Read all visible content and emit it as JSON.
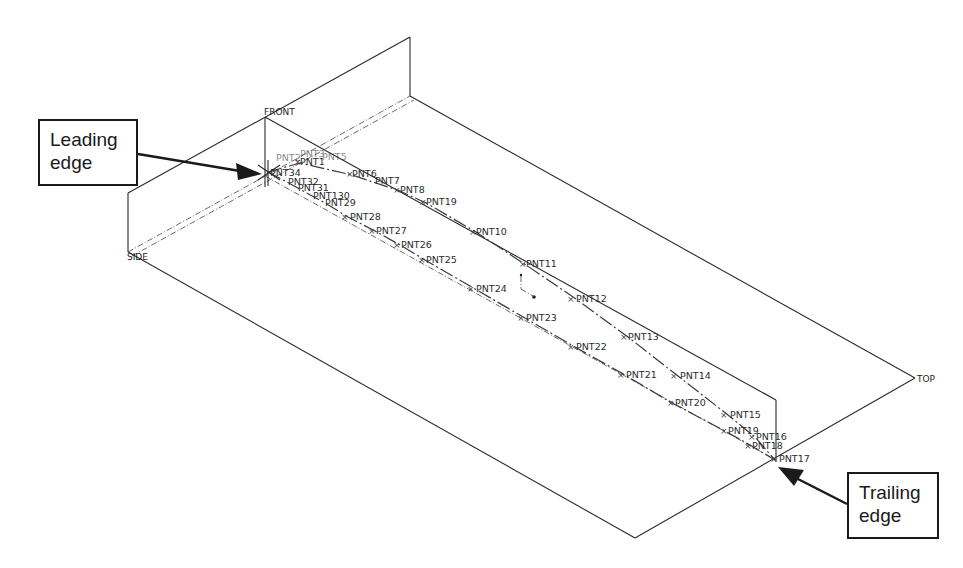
{
  "diagram": {
    "planes": [
      {
        "name": "FRONT",
        "label_pos": [
          264,
          115
        ]
      },
      {
        "name": "SIDE",
        "label_pos": [
          127,
          260
        ]
      },
      {
        "name": "TOP",
        "label_pos": [
          917,
          382
        ]
      }
    ],
    "callouts": {
      "leading": {
        "line1": "Leading",
        "line2": "edge"
      },
      "trailing": {
        "line1": "Trailing",
        "line2": "edge"
      }
    },
    "upper_surface_points": [
      {
        "label": "PNT1",
        "x": 300,
        "y": 163
      },
      {
        "label": "PNT6",
        "x": 352,
        "y": 175
      },
      {
        "label": "PNT7",
        "x": 375,
        "y": 182
      },
      {
        "label": "PNT8",
        "x": 400,
        "y": 191
      },
      {
        "label": "PNT19",
        "x": 426,
        "y": 203
      },
      {
        "label": "PNT10",
        "x": 476,
        "y": 232
      },
      {
        "label": "PNT11",
        "x": 526,
        "y": 265
      },
      {
        "label": "PNT12",
        "x": 576,
        "y": 299
      },
      {
        "label": "PNT13",
        "x": 628,
        "y": 337
      },
      {
        "label": "PNT14",
        "x": 678,
        "y": 376
      },
      {
        "label": "PNT15",
        "x": 728,
        "y": 415
      },
      {
        "label": "PNT16",
        "x": 755,
        "y": 437
      }
    ],
    "lower_surface_points": [
      {
        "label": "PNT34",
        "x": 270,
        "y": 173
      },
      {
        "label": "PNT32",
        "x": 285,
        "y": 181
      },
      {
        "label": "PNT31",
        "x": 298,
        "y": 189
      },
      {
        "label": "PNT130",
        "x": 318,
        "y": 196
      },
      {
        "label": "PNT29",
        "x": 325,
        "y": 203
      },
      {
        "label": "PNT28",
        "x": 348,
        "y": 217
      },
      {
        "label": "PNT27",
        "x": 375,
        "y": 231
      },
      {
        "label": "PNT26",
        "x": 400,
        "y": 245
      },
      {
        "label": "PNT25",
        "x": 425,
        "y": 260
      },
      {
        "label": "PNT24",
        "x": 475,
        "y": 289
      },
      {
        "label": "PNT23",
        "x": 525,
        "y": 318
      },
      {
        "label": "PNT22",
        "x": 575,
        "y": 347
      },
      {
        "label": "PNT21",
        "x": 625,
        "y": 375
      },
      {
        "label": "PNT20",
        "x": 672,
        "y": 403
      },
      {
        "label": "PNT19",
        "x": 725,
        "y": 431
      },
      {
        "label": "PNT18",
        "x": 750,
        "y": 445
      }
    ],
    "trailing_point": {
      "label": "PNT17",
      "x": 775,
      "y": 460
    },
    "leading_cluster_labels": [
      "PNT2",
      "PNT3",
      "PNT4",
      "PNT5",
      "PNT33"
    ]
  }
}
